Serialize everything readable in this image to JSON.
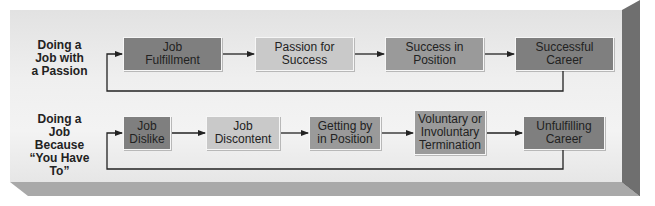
{
  "diagram": {
    "rows": [
      {
        "label": "Doing a Job with a Passion",
        "label_lines": [
          "Doing a",
          "Job with",
          "a Passion"
        ],
        "steps": [
          {
            "id": "job-fulfillment",
            "lines": [
              "Job",
              "Fulfillment"
            ],
            "shade": "dark"
          },
          {
            "id": "passion-for-success",
            "lines": [
              "Passion for",
              "Success"
            ],
            "shade": "light"
          },
          {
            "id": "success-in-position",
            "lines": [
              "Success in",
              "Position"
            ],
            "shade": "mid"
          },
          {
            "id": "successful-career",
            "lines": [
              "Successful",
              "Career"
            ],
            "shade": "dark"
          }
        ],
        "feedback": "Successful Career loops back to Job Fulfillment"
      },
      {
        "label": "Doing a Job Because “You Have To”",
        "label_lines": [
          "Doing a",
          "Job",
          "Because",
          "“You Have",
          "To”"
        ],
        "steps": [
          {
            "id": "job-dislike",
            "lines": [
              "Job",
              "Dislike"
            ],
            "shade": "dark"
          },
          {
            "id": "job-discontent",
            "lines": [
              "Job",
              "Discontent"
            ],
            "shade": "light"
          },
          {
            "id": "getting-by-in-position",
            "lines": [
              "Getting by",
              "in Position"
            ],
            "shade": "mid"
          },
          {
            "id": "voluntary-or-involuntary-termination",
            "lines": [
              "Voluntary or",
              "Involuntary",
              "Termination"
            ],
            "shade": "mid"
          },
          {
            "id": "unfulfilling-career",
            "lines": [
              "Unfulfilling",
              "Career"
            ],
            "shade": "dark"
          }
        ],
        "feedback": "Unfulfilling Career loops back to Job Dislike"
      }
    ],
    "colors": {
      "dark_box": "#7f7f7f",
      "mid_box": "#9a9a9a",
      "light_box": "#c9c9c9",
      "arrow": "#222222",
      "frame_face": "#efefef",
      "bevel_right": "#6f6f6f",
      "bevel_bottom": "#a9a9a9"
    }
  }
}
